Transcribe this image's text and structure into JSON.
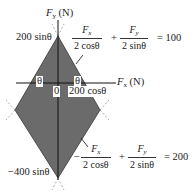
{
  "axes": {
    "y_label": "F_y (N)",
    "x_label": "F_x (N)",
    "origin_label": "0"
  },
  "vertex_labels": {
    "top": "200 sinθ",
    "bottom": "−400 sinθ",
    "x_intercept": "200 cosθ"
  },
  "angle_labels": [
    "θ",
    "θ"
  ],
  "equations": {
    "upper": {
      "term1_num": "F_x",
      "term1_den": "2 cosθ",
      "op": "+",
      "term2_num": "F_y",
      "term2_den": "2 sinθ",
      "rhs": "= 100"
    },
    "lower": {
      "sign": "−",
      "term1_num": "F_x",
      "term1_den": "2 cosθ",
      "op": "+",
      "term2_num": "F_y",
      "term2_den": "2 sinθ",
      "rhs": "= 200"
    }
  },
  "colors": {
    "fill": "#6b6b6b",
    "line": "#222222",
    "dashed": "#888888"
  }
}
